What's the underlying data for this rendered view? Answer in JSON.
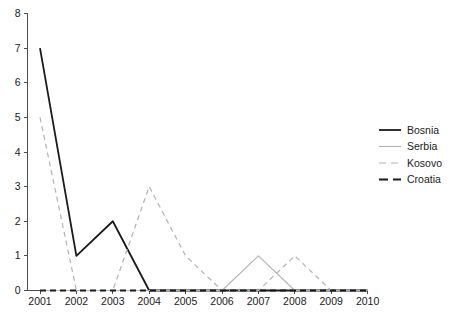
{
  "chart_data": {
    "type": "line",
    "title": "",
    "subtitle": "",
    "xlabel": "",
    "ylabel": "",
    "categories": [
      "2001",
      "2002",
      "2003",
      "2004",
      "2005",
      "2006",
      "2007",
      "2008",
      "2009",
      "2010"
    ],
    "x": [
      2001,
      2002,
      2003,
      2004,
      2005,
      2006,
      2007,
      2008,
      2009,
      2010
    ],
    "xlim": [
      2001,
      2010
    ],
    "ylim": [
      0,
      8
    ],
    "yticks": [
      0,
      1,
      2,
      3,
      4,
      5,
      6,
      7,
      8
    ],
    "ytick_labels": [
      "0",
      "1",
      "2",
      "3",
      "4",
      "5",
      "6",
      "7",
      "8"
    ],
    "grid": false,
    "legend_position": "right",
    "series": [
      {
        "name": "Bosnia",
        "values": [
          7,
          1,
          2,
          0,
          0,
          0,
          0,
          0,
          0,
          0
        ],
        "color": "#1a1a1a",
        "style": "solid",
        "width": 1.8
      },
      {
        "name": "Serbia",
        "values": [
          0,
          0,
          0,
          0,
          0,
          0,
          1,
          0,
          0,
          0
        ],
        "color": "#b3b3b3",
        "style": "solid",
        "width": 1.1
      },
      {
        "name": "Kosovo",
        "values": [
          5,
          0,
          0,
          3,
          1,
          0,
          0,
          1,
          0,
          0
        ],
        "color": "#b3b3b3",
        "style": "dashed",
        "width": 1.2
      },
      {
        "name": "Croatia",
        "values": [
          0,
          0,
          0,
          0,
          0,
          0,
          0,
          0,
          0,
          0
        ],
        "color": "#1a1a1a",
        "style": "dashed",
        "width": 1.8
      }
    ]
  },
  "legend": {
    "entries": [
      {
        "label": "Bosnia"
      },
      {
        "label": "Serbia"
      },
      {
        "label": "Kosovo"
      },
      {
        "label": "Croatia"
      }
    ]
  }
}
